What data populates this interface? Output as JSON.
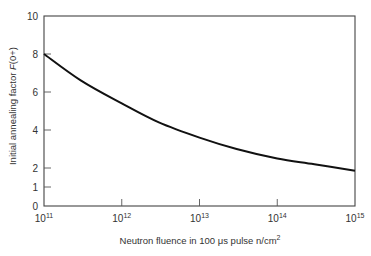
{
  "chart_data": {
    "type": "line",
    "title": "",
    "xlabel": "Neutron fluence in 100 μs pulse  n/cm²",
    "ylabel": "Initial annealing factor F(0+)",
    "xscale": "log",
    "xlim": [
      100000000000.0,
      1000000000000000.0
    ],
    "ylim": [
      0,
      10
    ],
    "x_ticks": [
      "10¹¹",
      "10¹²",
      "10¹³",
      "10¹⁴",
      "10¹⁵"
    ],
    "x_tick_values": [
      100000000000.0,
      1000000000000.0,
      10000000000000.0,
      100000000000000.0,
      1000000000000000.0
    ],
    "y_ticks": [
      "0",
      "1",
      "2",
      "4",
      "6",
      "8",
      "10"
    ],
    "y_tick_values": [
      0,
      1,
      2,
      4,
      6,
      8,
      10
    ],
    "grid": false,
    "legend": null,
    "series": [
      {
        "name": "F(0+)",
        "x": [
          100000000000.0,
          300000000000.0,
          1000000000000.0,
          3000000000000.0,
          10000000000000.0,
          30000000000000.0,
          100000000000000.0,
          300000000000000.0,
          1000000000000000.0
        ],
        "values": [
          8.0,
          6.6,
          5.4,
          4.4,
          3.6,
          3.0,
          2.5,
          2.2,
          1.85
        ]
      }
    ]
  },
  "labels": {
    "xlabel_prefix": "Neutron fluence in 100 ",
    "xlabel_mu": "μ",
    "xlabel_suffix": "s pulse  n/cm",
    "xlabel_sup": "2",
    "ylabel_prefix": "Initial annealing factor ",
    "ylabel_italic": "F",
    "ylabel_suffix": "(0+)"
  },
  "x_tick_labels": [
    {
      "base": "10",
      "exp": "11"
    },
    {
      "base": "10",
      "exp": "12"
    },
    {
      "base": "10",
      "exp": "13"
    },
    {
      "base": "10",
      "exp": "14"
    },
    {
      "base": "10",
      "exp": "15"
    }
  ],
  "y_tick_labels": [
    "0",
    "1",
    "2",
    "4",
    "6",
    "8",
    "10"
  ]
}
